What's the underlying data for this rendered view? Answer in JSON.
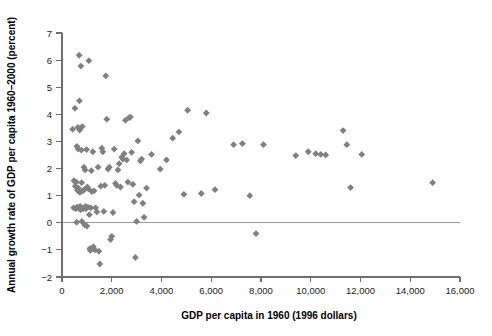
{
  "chart_data": {
    "type": "scatter",
    "title": "",
    "xlabel": "GDP per capita in 1960 (1996 dollars)",
    "ylabel": "Annual growth rate of GDP per capita 1960–2000 (percent)",
    "xlim": [
      0,
      16000
    ],
    "ylim": [
      -2,
      7
    ],
    "xticks": [
      0,
      2000,
      4000,
      6000,
      8000,
      10000,
      12000,
      14000,
      16000
    ],
    "xticklabels": [
      "0",
      "2,000",
      "4,000",
      "6,000",
      "8,000",
      "10,000",
      "12,000",
      "14,000",
      "16,000"
    ],
    "yticks": [
      -2,
      -1,
      0,
      1,
      2,
      3,
      4,
      5,
      6,
      7
    ],
    "yticklabels": [
      "−2",
      "−1",
      "0",
      "1",
      "2",
      "3",
      "4",
      "5",
      "6",
      "7"
    ],
    "grid": false,
    "legend": null,
    "marker": "diamond",
    "marker_color": "#808080",
    "reference_line": {
      "axis": "y",
      "value": 0,
      "color": "#9a9a9a"
    },
    "series": [
      {
        "name": "Countries",
        "points": [
          [
            430,
            3.45
          ],
          [
            470,
            0.55
          ],
          [
            480,
            1.55
          ],
          [
            520,
            4.22
          ],
          [
            530,
            1.35
          ],
          [
            560,
            0.52
          ],
          [
            575,
            1.5
          ],
          [
            590,
            0.02
          ],
          [
            600,
            2.82
          ],
          [
            610,
            0.58
          ],
          [
            620,
            1.2
          ],
          [
            640,
            3.52
          ],
          [
            650,
            2.72
          ],
          [
            660,
            1.28
          ],
          [
            670,
            0.55
          ],
          [
            690,
            6.18
          ],
          [
            700,
            4.5
          ],
          [
            710,
            3.42
          ],
          [
            720,
            1.12
          ],
          [
            730,
            0.6
          ],
          [
            745,
            0.48
          ],
          [
            760,
            5.78
          ],
          [
            780,
            2.68
          ],
          [
            790,
            1.48
          ],
          [
            800,
            0.05
          ],
          [
            815,
            3.55
          ],
          [
            830,
            1.18
          ],
          [
            845,
            0.55
          ],
          [
            860,
            0.52
          ],
          [
            880,
            2.05
          ],
          [
            900,
            1.22
          ],
          [
            915,
            -0.08
          ],
          [
            930,
            1.95
          ],
          [
            950,
            0.6
          ],
          [
            965,
            0.52
          ],
          [
            985,
            2.7
          ],
          [
            1000,
            -0.12
          ],
          [
            1020,
            1.32
          ],
          [
            1040,
            0.58
          ],
          [
            1060,
            1.25
          ],
          [
            1080,
            5.98
          ],
          [
            1100,
            0.3
          ],
          [
            1120,
            -0.95
          ],
          [
            1140,
            -1.02
          ],
          [
            1160,
            0.55
          ],
          [
            1180,
            1.92
          ],
          [
            1200,
            1.15
          ],
          [
            1240,
            2.62
          ],
          [
            1260,
            -0.88
          ],
          [
            1290,
            1.18
          ],
          [
            1320,
            -1.0
          ],
          [
            1350,
            0.55
          ],
          [
            1400,
            0.4
          ],
          [
            1450,
            2.05
          ],
          [
            1480,
            -1.05
          ],
          [
            1520,
            -1.52
          ],
          [
            1560,
            1.35
          ],
          [
            1600,
            2.75
          ],
          [
            1640,
            2.62
          ],
          [
            1680,
            0.42
          ],
          [
            1720,
            1.38
          ],
          [
            1760,
            5.42
          ],
          [
            1800,
            3.82
          ],
          [
            1850,
            1.98
          ],
          [
            1900,
            2.05
          ],
          [
            1950,
            -0.62
          ],
          [
            2000,
            -0.5
          ],
          [
            2050,
            0.38
          ],
          [
            2100,
            2.72
          ],
          [
            2150,
            1.45
          ],
          [
            2200,
            1.38
          ],
          [
            2250,
            1.95
          ],
          [
            2300,
            2.18
          ],
          [
            2350,
            1.32
          ],
          [
            2400,
            2.42
          ],
          [
            2450,
            2.35
          ],
          [
            2500,
            2.55
          ],
          [
            2550,
            3.78
          ],
          [
            2600,
            2.32
          ],
          [
            2650,
            1.5
          ],
          [
            2700,
            3.88
          ],
          [
            2750,
            3.9
          ],
          [
            2800,
            2.6
          ],
          [
            2850,
            1.42
          ],
          [
            2900,
            0.78
          ],
          [
            2950,
            -1.28
          ],
          [
            3000,
            0.05
          ],
          [
            3050,
            3.02
          ],
          [
            3100,
            1.02
          ],
          [
            3150,
            2.28
          ],
          [
            3200,
            2.35
          ],
          [
            3250,
            0.72
          ],
          [
            3300,
            0.2
          ],
          [
            3400,
            1.28
          ],
          [
            3600,
            2.52
          ],
          [
            3950,
            1.98
          ],
          [
            4200,
            2.32
          ],
          [
            4450,
            3.12
          ],
          [
            4700,
            3.35
          ],
          [
            4900,
            1.05
          ],
          [
            5050,
            4.15
          ],
          [
            5600,
            1.08
          ],
          [
            5800,
            4.05
          ],
          [
            6150,
            1.22
          ],
          [
            6900,
            2.88
          ],
          [
            7250,
            2.92
          ],
          [
            7550,
            1.0
          ],
          [
            7800,
            -0.4
          ],
          [
            8100,
            2.88
          ],
          [
            9400,
            2.48
          ],
          [
            9900,
            2.62
          ],
          [
            10200,
            2.55
          ],
          [
            10400,
            2.52
          ],
          [
            10600,
            2.5
          ],
          [
            11300,
            3.4
          ],
          [
            11450,
            2.88
          ],
          [
            11600,
            1.3
          ],
          [
            12050,
            2.52
          ],
          [
            14900,
            1.48
          ]
        ]
      }
    ]
  },
  "axis": {
    "y_title": "Annual growth rate of GDP per capita 1960–2000 (percent)",
    "x_title": "GDP per capita in 1960 (1996 dollars)"
  }
}
